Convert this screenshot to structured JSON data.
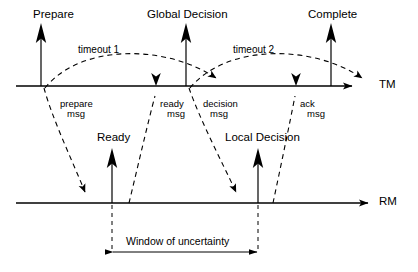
{
  "diagram": {
    "timelines": [
      {
        "key": "tm",
        "label": "TM",
        "description": "Transaction Manager timeline"
      },
      {
        "key": "rm",
        "label": "RM",
        "description": "Resource Manager timeline"
      }
    ],
    "tm_events": [
      {
        "key": "prepare",
        "label": "Prepare"
      },
      {
        "key": "global_decision",
        "label": "Global Decision"
      },
      {
        "key": "complete",
        "label": "Complete"
      }
    ],
    "rm_events": [
      {
        "key": "ready",
        "label": "Ready"
      },
      {
        "key": "local_decision",
        "label": "Local Decision"
      }
    ],
    "timeouts": [
      {
        "key": "timeout1",
        "label": "timeout 1"
      },
      {
        "key": "timeout2",
        "label": "timeout 2"
      }
    ],
    "messages": [
      {
        "key": "prepare_msg",
        "line1": "prepare",
        "line2": "msg",
        "direction": "tm-to-rm"
      },
      {
        "key": "ready_msg",
        "line1": "ready",
        "line2": "msg",
        "direction": "rm-to-tm"
      },
      {
        "key": "decision_msg",
        "line1": "decision",
        "line2": "msg",
        "direction": "tm-to-rm"
      },
      {
        "key": "ack_msg",
        "line1": "ack",
        "line2": "msg",
        "direction": "rm-to-tm"
      }
    ],
    "annotation": {
      "window_label": "Window of uncertainty"
    },
    "colors": {
      "stroke": "#000000",
      "background": "#ffffff"
    }
  }
}
